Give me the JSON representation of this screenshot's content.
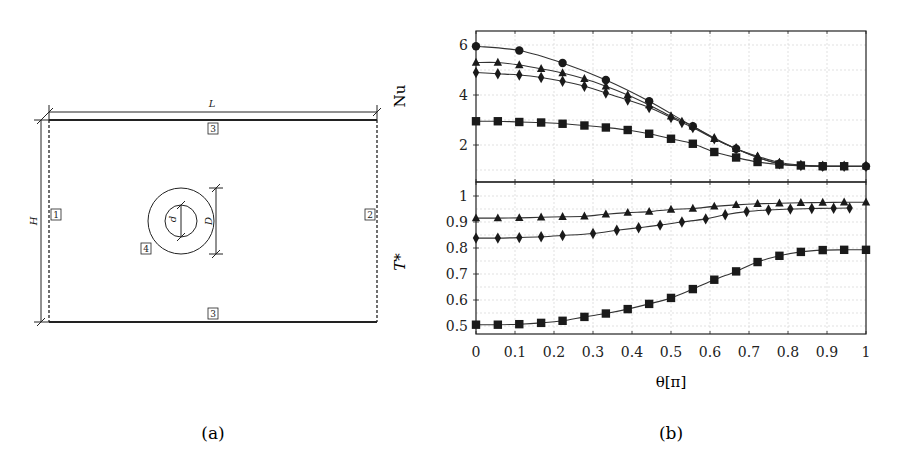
{
  "figure": {
    "subfigure_a": {
      "caption": "(a)",
      "labels": {
        "L": "L",
        "H": "H",
        "d": "d",
        "D": "D"
      },
      "boundary_tags": [
        "1",
        "2",
        "3",
        "3",
        "4"
      ]
    },
    "subfigure_b": {
      "caption": "(b)",
      "xlabel": "θ[π]",
      "ylabel_top": "Nu",
      "ylabel_bottom": "T*"
    }
  },
  "chart_data": [
    {
      "type": "line",
      "panel": "top",
      "title": "",
      "xlabel": "θ[π]",
      "ylabel": "Nu",
      "xlim": [
        0,
        1
      ],
      "ylim": [
        0.5,
        6.5
      ],
      "xticks": [
        0,
        0.1,
        0.2,
        0.3,
        0.4,
        0.5,
        0.6,
        0.7,
        0.8,
        0.9,
        1
      ],
      "yticks": [
        2,
        4,
        6
      ],
      "grid": true,
      "legend": "none",
      "series": [
        {
          "name": "circle",
          "marker": "circle",
          "x": [
            0,
            0.111,
            0.222,
            0.333,
            0.444,
            0.556,
            0.667,
            0.778,
            0.889,
            1
          ],
          "y": [
            5.95,
            5.78,
            5.28,
            4.6,
            3.75,
            2.75,
            1.85,
            1.25,
            1.15,
            1.15
          ]
        },
        {
          "name": "triangle",
          "marker": "triangle",
          "x": [
            0,
            0.056,
            0.111,
            0.167,
            0.222,
            0.278,
            0.333,
            0.389,
            0.444,
            0.5,
            0.556,
            0.611,
            0.667,
            0.722,
            0.778,
            0.833,
            0.889,
            0.944,
            1
          ],
          "y": [
            5.3,
            5.3,
            5.2,
            5.05,
            4.88,
            4.65,
            4.35,
            4.0,
            3.6,
            3.15,
            2.75,
            2.25,
            1.85,
            1.55,
            1.3,
            1.2,
            1.15,
            1.15,
            1.15
          ]
        },
        {
          "name": "diamond",
          "marker": "diamond",
          "x": [
            0,
            0.056,
            0.111,
            0.167,
            0.222,
            0.278,
            0.333,
            0.389,
            0.444,
            0.5,
            0.528,
            0.556,
            0.611,
            0.667,
            0.722,
            0.778,
            0.833,
            0.889,
            0.944,
            1
          ],
          "y": [
            4.9,
            4.85,
            4.8,
            4.7,
            4.55,
            4.35,
            4.08,
            3.8,
            3.5,
            3.1,
            2.9,
            2.7,
            2.25,
            1.85,
            1.5,
            1.25,
            1.18,
            1.15,
            1.15,
            1.15
          ]
        },
        {
          "name": "square",
          "marker": "square",
          "x": [
            0,
            0.056,
            0.111,
            0.167,
            0.222,
            0.278,
            0.333,
            0.389,
            0.444,
            0.5,
            0.556,
            0.611,
            0.667,
            0.722,
            0.778,
            0.833,
            0.889,
            0.944
          ],
          "y": [
            2.95,
            2.95,
            2.92,
            2.9,
            2.85,
            2.78,
            2.7,
            2.6,
            2.45,
            2.25,
            2.05,
            1.72,
            1.5,
            1.32,
            1.22,
            1.18,
            1.15,
            1.15
          ]
        }
      ]
    },
    {
      "type": "line",
      "panel": "bottom",
      "title": "",
      "xlabel": "θ[π]",
      "ylabel": "T*",
      "xlim": [
        0,
        1
      ],
      "ylim": [
        0.48,
        1.05
      ],
      "xticks": [
        0,
        0.1,
        0.2,
        0.3,
        0.4,
        0.5,
        0.6,
        0.7,
        0.8,
        0.9,
        1
      ],
      "xtick_labels": [
        "0",
        "0.1",
        "0.2",
        "0.3",
        "0.4",
        "0.5",
        "0.6",
        "0.7",
        "0.8",
        "0.9",
        "1"
      ],
      "yticks": [
        0.5,
        0.6,
        0.7,
        0.8,
        0.9,
        1
      ],
      "ytick_labels": [
        "0.5",
        "0.6",
        "0.7",
        "0.8",
        "0.9",
        "1"
      ],
      "grid": true,
      "legend": "none",
      "series": [
        {
          "name": "triangle",
          "marker": "triangle",
          "x": [
            0,
            0.056,
            0.111,
            0.167,
            0.222,
            0.278,
            0.333,
            0.389,
            0.444,
            0.5,
            0.556,
            0.611,
            0.667,
            0.722,
            0.778,
            0.833,
            0.889,
            0.944,
            1
          ],
          "y": [
            0.915,
            0.915,
            0.916,
            0.918,
            0.92,
            0.922,
            0.93,
            0.936,
            0.94,
            0.948,
            0.952,
            0.96,
            0.966,
            0.97,
            0.972,
            0.974,
            0.975,
            0.976,
            0.976
          ]
        },
        {
          "name": "diamond",
          "marker": "diamond",
          "x": [
            0,
            0.056,
            0.111,
            0.167,
            0.222,
            0.3,
            0.361,
            0.417,
            0.472,
            0.528,
            0.589,
            0.639,
            0.694,
            0.75,
            0.806,
            0.861,
            0.917,
            0.958
          ],
          "y": [
            0.838,
            0.838,
            0.84,
            0.843,
            0.848,
            0.856,
            0.868,
            0.878,
            0.888,
            0.9,
            0.912,
            0.928,
            0.94,
            0.946,
            0.95,
            0.952,
            0.953,
            0.954
          ]
        },
        {
          "name": "square",
          "marker": "square",
          "x": [
            0,
            0.056,
            0.111,
            0.167,
            0.222,
            0.278,
            0.333,
            0.389,
            0.444,
            0.5,
            0.556,
            0.611,
            0.667,
            0.722,
            0.778,
            0.833,
            0.889,
            0.944,
            1
          ],
          "y": [
            0.505,
            0.505,
            0.507,
            0.512,
            0.52,
            0.535,
            0.548,
            0.565,
            0.585,
            0.608,
            0.642,
            0.678,
            0.71,
            0.746,
            0.77,
            0.785,
            0.792,
            0.793,
            0.793
          ]
        }
      ]
    }
  ]
}
